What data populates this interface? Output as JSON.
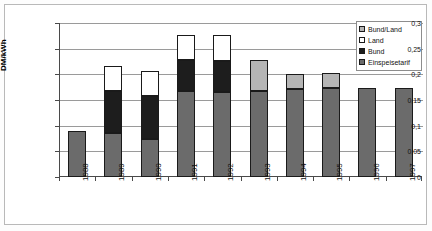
{
  "chart_data": {
    "type": "bar",
    "title": "",
    "subtitle": "",
    "xlabel": "",
    "ylabel": "DM/kWh",
    "ylim": [
      0,
      0.3
    ],
    "ytick_labels": [
      "0",
      "0,05",
      "0,1",
      "0,15",
      "0,2",
      "0,25",
      "0,3"
    ],
    "ytick_values": [
      0,
      0.05,
      0.1,
      0.15,
      0.2,
      0.25,
      0.3
    ],
    "grid": true,
    "stacked": true,
    "legend_position": "top-right",
    "categories": [
      "1988",
      "1989",
      "1990",
      "1991",
      "1992",
      "1993",
      "1994",
      "1995",
      "1996",
      "1997"
    ],
    "series": [
      {
        "name": "Einspeisetarif",
        "color": "#6b6b6b",
        "values": [
          0.089,
          0.086,
          0.074,
          0.167,
          0.165,
          0.167,
          0.171,
          0.173,
          0.173,
          0.173
        ]
      },
      {
        "name": "Bund",
        "color": "#1d1d1d",
        "values": [
          0,
          0.081,
          0.083,
          0.06,
          0.061,
          0,
          0,
          0,
          0,
          0
        ]
      },
      {
        "name": "Land",
        "color": "#ffffff",
        "values": [
          0,
          0.05,
          0.049,
          0.05,
          0.05,
          0,
          0,
          0,
          0,
          0
        ]
      },
      {
        "name": "Bund/Land",
        "color": "#b5b5b5",
        "values": [
          0,
          0,
          0,
          0,
          0,
          0.06,
          0.029,
          0.03,
          0,
          0
        ]
      }
    ],
    "totals": [
      0.089,
      0.217,
      0.206,
      0.277,
      0.276,
      0.227,
      0.2,
      0.203,
      0.173,
      0.173
    ]
  },
  "legend": {
    "items": [
      {
        "label": "Bund/Land",
        "swatch": "bundland"
      },
      {
        "label": "Land",
        "swatch": "land"
      },
      {
        "label": "Bund",
        "swatch": "bund"
      },
      {
        "label": "Einspeisetarif",
        "swatch": "einspeise"
      }
    ]
  }
}
